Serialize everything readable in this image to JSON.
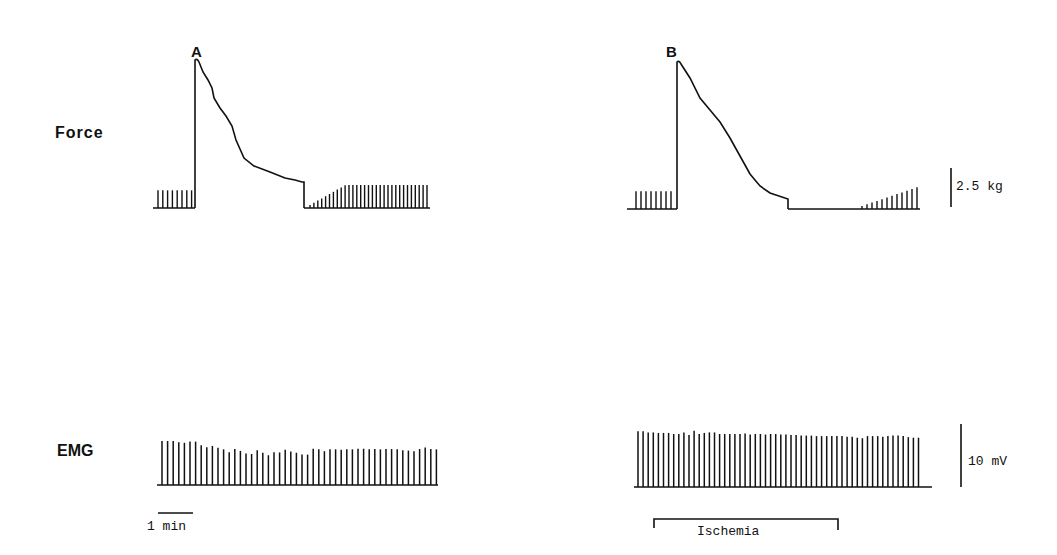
{
  "figure": {
    "panels": [
      {
        "label": "A"
      },
      {
        "label": "B"
      }
    ],
    "rows": [
      {
        "label": "Force"
      },
      {
        "label": "EMG"
      }
    ],
    "scale_bars": {
      "force": "2.5 kg",
      "emg": "10 mV",
      "time": "1 min"
    },
    "annotation": "Ischemia",
    "colors": {
      "trace": "#111111",
      "background": "#ffffff"
    }
  },
  "chart_data": [
    {
      "type": "line",
      "title": "A — Force",
      "ylabel": "Force",
      "scale": "2.5 kg",
      "description": "Baseline twitches (~8), sustained maximal contraction with decay to plateau, then recovery of twitches",
      "baseline_twitch_height_kg": 1.3,
      "peak_kg": 6.4,
      "plateau_kg": 2.8,
      "recovery_twitch_final_kg": 1.1,
      "baseline_twitch_count": 8,
      "recovery_twitch_count": 31
    },
    {
      "type": "line",
      "title": "B — Force",
      "ylabel": "Force",
      "scale": "2.5 kg",
      "description": "Baseline twitches, maximal contraction decaying linearly to zero under ischemia, delayed twitch recovery",
      "baseline_twitch_height_kg": 1.3,
      "peak_kg": 6.3,
      "end_of_contraction_kg": 0.3,
      "recovery_twitch_final_kg": 0.8,
      "baseline_twitch_count": 8,
      "recovery_twitch_count": 12
    },
    {
      "type": "bar",
      "title": "A — EMG",
      "ylabel": "EMG",
      "scale": "10 mV",
      "time_scale": "1 min",
      "values": [
        14.2,
        14.2,
        14.2,
        13.8,
        13.6,
        14.0,
        14.0,
        12.8,
        12.2,
        12.6,
        12.0,
        11.5,
        10.6,
        11.6,
        11.0,
        10.2,
        10.0,
        11.2,
        10.4,
        9.6,
        10.6,
        10.5,
        11.4,
        10.8,
        10.4,
        9.8,
        9.8,
        11.7,
        11.5,
        10.9,
        11.5,
        11.5,
        11.4,
        11.5,
        11.5,
        11.7,
        11.7,
        11.5,
        11.6,
        11.5,
        11.6,
        11.6,
        11.5,
        11.2,
        11.1,
        10.9,
        11.6,
        12.1,
        11.6,
        11.5
      ]
    },
    {
      "type": "bar",
      "title": "B — EMG",
      "ylabel": "EMG",
      "scale": "10 mV",
      "annotation": "Ischemia",
      "values": [
        10.5,
        10.5,
        10.3,
        10.3,
        10.2,
        10.2,
        10.2,
        10.0,
        10.0,
        10.3,
        9.8,
        10.6,
        10.0,
        10.2,
        10.3,
        10.3,
        10.0,
        10.0,
        10.0,
        10.0,
        10.0,
        10.1,
        9.9,
        10.0,
        10.0,
        9.9,
        10.0,
        10.0,
        9.9,
        9.9,
        9.8,
        9.8,
        9.7,
        9.7,
        9.7,
        9.6,
        9.6,
        9.6,
        9.6,
        9.6,
        9.6,
        9.5,
        9.5,
        9.3,
        9.2,
        9.6,
        9.6,
        9.6,
        9.5,
        9.6,
        9.7,
        9.7,
        9.6,
        9.4,
        9.3,
        9.3
      ]
    }
  ]
}
